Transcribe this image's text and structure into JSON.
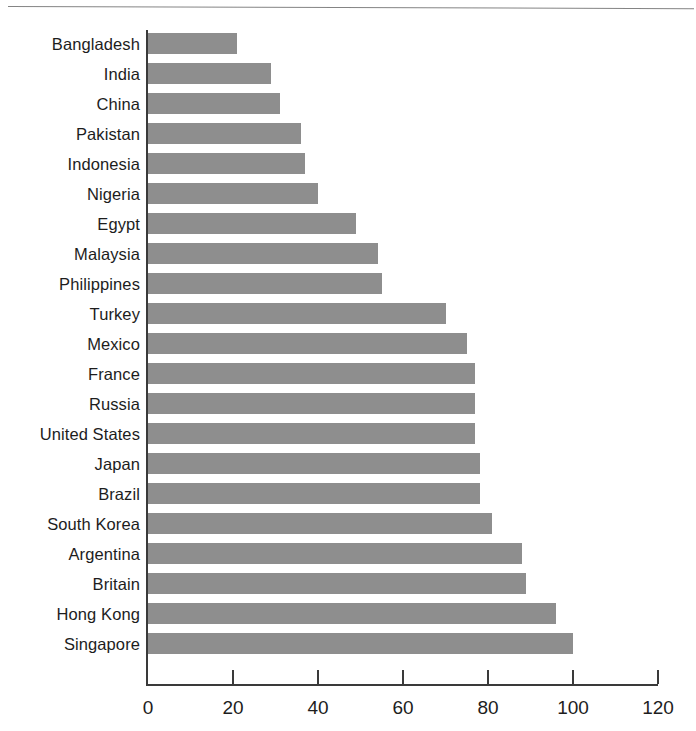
{
  "chart_data": {
    "type": "bar",
    "orientation": "horizontal",
    "title": "",
    "subtitle": "",
    "xlabel": "",
    "ylabel": "",
    "xlim": [
      0,
      120
    ],
    "xticks": [
      0,
      20,
      40,
      60,
      80,
      100,
      120
    ],
    "xtick_labels": [
      "0",
      "20",
      "40",
      "60",
      "80",
      "100",
      "120"
    ],
    "grid": false,
    "legend": null,
    "bar_color": "#8e8e8e",
    "axis_color": "#3a3a3a",
    "background_color": "#ffffff",
    "categories": [
      "Bangladesh",
      "India",
      "China",
      "Pakistan",
      "Indonesia",
      "Nigeria",
      "Egypt",
      "Malaysia",
      "Philippines",
      "Turkey",
      "Mexico",
      "France",
      "Russia",
      "United States",
      "Japan",
      "Brazil",
      "South Korea",
      "Argentina",
      "Britain",
      "Hong Kong",
      "Singapore"
    ],
    "values": [
      21,
      29,
      31,
      36,
      37,
      40,
      49,
      54,
      55,
      70,
      75,
      77,
      77,
      77,
      78,
      78,
      81,
      88,
      89,
      96,
      100
    ]
  }
}
